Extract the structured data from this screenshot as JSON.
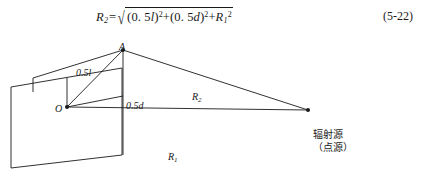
{
  "equation": {
    "lhs_var": "R",
    "lhs_sub": "2",
    "equals": "=",
    "radical_sign": "√",
    "term1_open": "(",
    "term1_value": "0. 5",
    "term1_var": "l",
    "term1_close": ")",
    "term1_exp": "2",
    "plus1": "+",
    "term2_open": "(",
    "term2_value": "0. 5",
    "term2_var": "d",
    "term2_close": ")",
    "term2_exp": "2",
    "plus2": "+",
    "term3_var": "R",
    "term3_sub": "1",
    "term3_exp": "2",
    "number": "(5-22)",
    "plain_text": "R2 = √((0.5l)² + (0.5d)² + R1²)"
  },
  "diagram": {
    "labels": {
      "point_a": "A",
      "point_o": "O",
      "half_l": "0.5l",
      "half_l_value": "0.5",
      "half_l_var": "l",
      "half_d": "0.5d",
      "half_d_value": "0.5",
      "half_d_var": "d",
      "r2_var": "R",
      "r2_sub": "2",
      "r1_var": "R",
      "r1_sub": "1",
      "source_line1": "辐射源",
      "source_line2": "（点源）"
    },
    "colors": {
      "stroke": "#1a1a1a",
      "background": "#ffffff",
      "text": "#1a1a1a"
    },
    "points": {
      "a": [
        123,
        10
      ],
      "o": [
        67,
        67
      ],
      "source": [
        308,
        70
      ]
    }
  }
}
